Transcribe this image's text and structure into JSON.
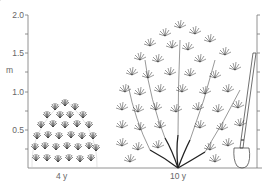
{
  "figure": {
    "title": "",
    "y_axis": {
      "unit_label": "m",
      "ticks": [
        "2.0",
        "1.5",
        "1.0",
        "0.5"
      ],
      "range": [
        0,
        2.0
      ]
    },
    "plants": [
      {
        "age_label": "4 y",
        "height_m": 0.6,
        "shape": "rounded dome shrub"
      },
      {
        "age_label": "10 y",
        "height_m": 1.75,
        "shape": "vase-shaped spreading shrub"
      }
    ],
    "scale_reference": {
      "object": "spade",
      "height_m": 1.2
    }
  },
  "colors": {
    "line": "#333333",
    "axis": "#777777",
    "text": "#666666"
  }
}
